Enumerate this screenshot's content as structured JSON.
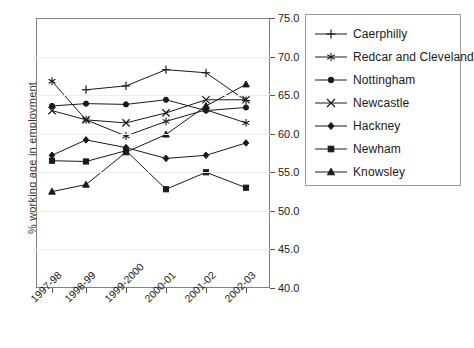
{
  "chart_data": {
    "type": "line",
    "title": "",
    "xlabel": "",
    "ylabel": "% working age in employment",
    "categories": [
      "1997-98",
      "1998-99",
      "1999-2000",
      "2000-01",
      "2001-02",
      "2002-03"
    ],
    "ylim": [
      40.0,
      75.0
    ],
    "ytick_step": 5.0,
    "ytick_labels": [
      "75.0",
      "70.0",
      "65.0",
      "60.0",
      "55.0",
      "50.0",
      "45.0",
      "40.0"
    ],
    "ytick_values": [
      75.0,
      70.0,
      65.0,
      60.0,
      55.0,
      50.0,
      45.0,
      40.0
    ],
    "grid": true,
    "legend_position": "right",
    "series": [
      {
        "name": "Caerphilly",
        "marker": "plus",
        "values": [
          null,
          65.7,
          66.2,
          68.3,
          67.9,
          64.3
        ]
      },
      {
        "name": "Redcar and Cleveland",
        "marker": "asterisk",
        "values": [
          66.8,
          61.8,
          59.7,
          61.6,
          63.1,
          61.4
        ]
      },
      {
        "name": "Nottingham",
        "marker": "circle",
        "values": [
          63.6,
          63.9,
          63.8,
          64.4,
          63.0,
          63.4
        ]
      },
      {
        "name": "Newcastle",
        "marker": "x",
        "values": [
          63.0,
          61.8,
          61.4,
          62.7,
          64.4,
          64.4
        ]
      },
      {
        "name": "Hackney",
        "marker": "diamond",
        "values": [
          57.2,
          59.2,
          58.2,
          56.8,
          57.2,
          58.8
        ]
      },
      {
        "name": "Newham",
        "marker": "square",
        "values": [
          56.5,
          56.4,
          57.8,
          52.8,
          55.0,
          53.0
        ]
      },
      {
        "name": "Knowsley",
        "marker": "triangle",
        "values": [
          52.5,
          53.4,
          57.6,
          59.9,
          63.6,
          66.4
        ]
      }
    ]
  },
  "legend": {
    "entries": [
      {
        "label": "Caerphilly"
      },
      {
        "label": "Redcar and Cleveland"
      },
      {
        "label": "Nottingham"
      },
      {
        "label": "Newcastle"
      },
      {
        "label": "Hackney"
      },
      {
        "label": "Newham"
      },
      {
        "label": "Knowsley"
      }
    ]
  },
  "colors": {
    "line": "#1a1a1a",
    "frame": "#808080",
    "grid": "#ececec",
    "text": "#1a1a1a",
    "background": "#ffffff"
  }
}
